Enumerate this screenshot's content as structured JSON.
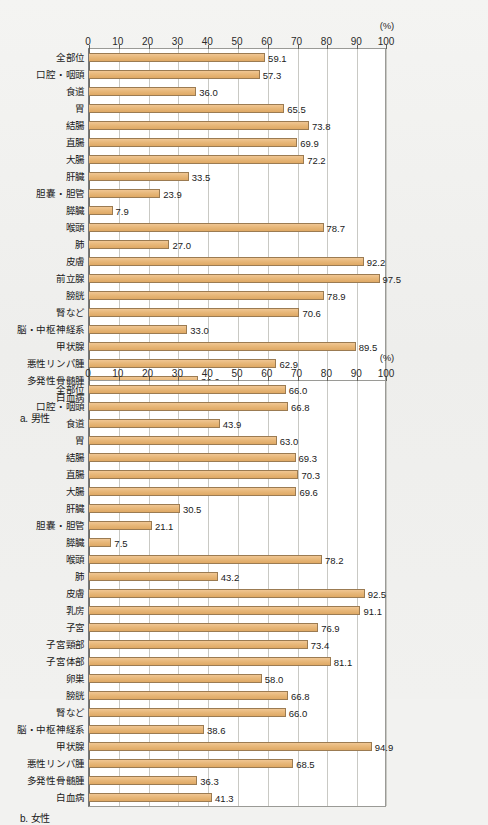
{
  "axis": {
    "unit_label": "(%)",
    "ticks": [
      0,
      10,
      20,
      30,
      40,
      50,
      60,
      70,
      80,
      90,
      100
    ],
    "min": 0,
    "max": 100
  },
  "panels": [
    {
      "id": "male",
      "caption": "a. 男性",
      "chart_index": 0
    },
    {
      "id": "female",
      "caption": "b. 女性",
      "chart_index": 1
    }
  ],
  "chart_data": [
    {
      "type": "bar",
      "orientation": "horizontal",
      "title": "a. 男性",
      "xlabel": "(%)",
      "ylabel": "",
      "xlim": [
        0,
        100
      ],
      "grid": true,
      "legend": "none",
      "categories": [
        "全部位",
        "口腔・咽頭",
        "食道",
        "胃",
        "結腸",
        "直腸",
        "大腸",
        "肝臓",
        "胆嚢・胆管",
        "膵臓",
        "喉頭",
        "肺",
        "皮膚",
        "前立腺",
        "膀胱",
        "腎など",
        "脳・中枢神経系",
        "甲状腺",
        "悪性リンパ腫",
        "多発性骨髄腫",
        "白血病"
      ],
      "values": [
        59.1,
        57.3,
        36.0,
        65.5,
        73.8,
        69.9,
        72.2,
        33.5,
        23.9,
        7.9,
        78.7,
        27.0,
        92.2,
        97.5,
        78.9,
        70.6,
        33.0,
        89.5,
        62.9,
        36.6,
        37.8
      ],
      "labels": [
        "59.1",
        "57.3",
        "36.0",
        "65.5",
        "73.8",
        "69.9",
        "72.2",
        "33.5",
        "23.9",
        "7.9",
        "78.7",
        "27.0",
        "92.2",
        "97.5",
        "78.9",
        "70.6",
        "33.0",
        "89.5",
        "62.9",
        "36.6",
        "37.8"
      ]
    },
    {
      "type": "bar",
      "orientation": "horizontal",
      "title": "b. 女性",
      "xlabel": "(%)",
      "ylabel": "",
      "xlim": [
        0,
        100
      ],
      "grid": true,
      "legend": "none",
      "categories": [
        "全部位",
        "口腔・咽頭",
        "食道",
        "胃",
        "結腸",
        "直腸",
        "大腸",
        "肝臓",
        "胆嚢・胆管",
        "膵臓",
        "喉頭",
        "肺",
        "皮膚",
        "乳房",
        "子宮",
        "子宮頸部",
        "子宮体部",
        "卵巣",
        "膀胱",
        "腎など",
        "脳・中枢神経系",
        "甲状腺",
        "悪性リンパ腫",
        "多発性骨髄腫",
        "白血病"
      ],
      "values": [
        66.0,
        66.8,
        43.9,
        63.0,
        69.3,
        70.3,
        69.6,
        30.5,
        21.1,
        7.5,
        78.2,
        43.2,
        92.5,
        91.1,
        76.9,
        73.4,
        81.1,
        58.0,
        66.8,
        66.0,
        38.6,
        94.9,
        68.5,
        36.3,
        41.3
      ],
      "labels": [
        "66.0",
        "66.8",
        "43.9",
        "63.0",
        "69.3",
        "70.3",
        "69.6",
        "30.5",
        "21.1",
        "7.5",
        "78.2",
        "43.2",
        "92.5",
        "91.1",
        "76.9",
        "73.4",
        "81.1",
        "58.0",
        "66.8",
        "66.0",
        "38.6",
        "94.9",
        "68.5",
        "36.3",
        "41.3"
      ]
    }
  ],
  "colors": {
    "bar_fill": "#e8b87a",
    "bar_stroke": "#9b7b52",
    "plot_bg": "#ffffff",
    "page_bg": "#f1f1ef",
    "gridline": "#c9c9c4",
    "axis": "#6d6d68",
    "text": "#1a1a1a"
  }
}
